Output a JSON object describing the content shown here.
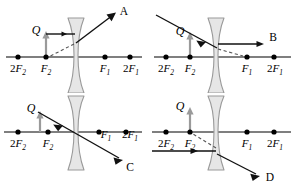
{
  "figure": {
    "colors": {
      "axis": "#555555",
      "ray": "#111111",
      "dashed_ray": "#555555",
      "object_arrow": "#9a9a9a",
      "lens_fill": "#e6e6e6",
      "lens_stroke": "#999999",
      "dot": "#000000",
      "text": "#000000"
    },
    "axis_labels": [
      "2F2",
      "F2",
      "F1",
      "2F1"
    ],
    "object_label": "Q",
    "lens_type": "biconcave-diverging"
  },
  "panels": [
    {
      "id": "panel-a",
      "answer_label": "A",
      "object_label": "Q",
      "axis_points": [
        {
          "label_base": "2",
          "label_f": "F",
          "label_sub": "2",
          "text": "2F2"
        },
        {
          "label_base": "",
          "label_f": "F",
          "label_sub": "2",
          "text": "F2"
        },
        {
          "label_base": "",
          "label_f": "F",
          "label_sub": "1",
          "text": "F1"
        },
        {
          "label_base": "2",
          "label_f": "F",
          "label_sub": "1",
          "text": "2F1"
        }
      ],
      "incident_ray": "horizontal parallel to axis from object tip to lens",
      "refracted_ray": "upward to the right toward A",
      "dashed_ray": "backward extension to F2"
    },
    {
      "id": "panel-b",
      "answer_label": "B",
      "object_label": "Q",
      "axis_points": [
        {
          "text": "2F2"
        },
        {
          "text": "F2"
        },
        {
          "text": "F1"
        },
        {
          "text": "2F1"
        }
      ],
      "incident_ray": "downward sloping from upper left to lens",
      "refracted_ray": "horizontal to the right toward B",
      "dashed_ray": "backward extension toward F1"
    },
    {
      "id": "panel-c",
      "answer_label": "C",
      "object_label": "Q",
      "axis_points": [
        {
          "text": "2F2"
        },
        {
          "text": "F2"
        },
        {
          "text": "F1"
        },
        {
          "text": "2F1"
        }
      ],
      "incident_ray": "from object tip sloping down through lens centre",
      "refracted_ray": "continues down to the right toward C",
      "dashed_ray": ""
    },
    {
      "id": "panel-d",
      "answer_label": "D",
      "object_label": "Q",
      "axis_points": [
        {
          "text": "2F2"
        },
        {
          "text": "F2"
        },
        {
          "text": "F1"
        },
        {
          "text": "2F1"
        }
      ],
      "incident_ray": "horizontal ray below the axis travelling right",
      "refracted_ray": "downward to the right toward D",
      "dashed_ray": "backward extension up to F2"
    }
  ]
}
